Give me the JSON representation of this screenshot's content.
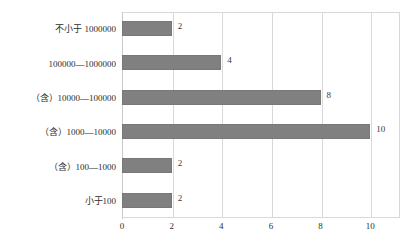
{
  "chart_data": {
    "type": "bar",
    "orientation": "horizontal",
    "title": "",
    "xlabel": "",
    "ylabel": "",
    "xlim": [
      0,
      11.2
    ],
    "grid": true,
    "legend": false,
    "bar_color": "#808080",
    "categories": [
      "不小于 1000000",
      "100000—1000000",
      "（含）10000—100000",
      "（含）1000—10000",
      "（含）100—1000",
      "小于100"
    ],
    "values": [
      2,
      4,
      8,
      10,
      2,
      2
    ],
    "value_labels": [
      "2",
      "4",
      "8",
      "10",
      "2",
      "2"
    ],
    "xticks": [
      0,
      2,
      4,
      6,
      8,
      10
    ],
    "xtick_labels": [
      "0",
      "2",
      "4",
      "6",
      "8",
      "10"
    ]
  }
}
